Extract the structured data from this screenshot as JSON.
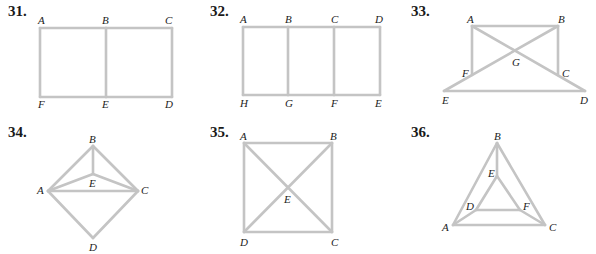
{
  "problems": [
    {
      "number": "31.",
      "vertices": {
        "A": [
          40,
          28
        ],
        "B": [
          106,
          28
        ],
        "C": [
          172,
          28
        ],
        "F": [
          40,
          97
        ],
        "E": [
          106,
          97
        ],
        "D": [
          172,
          97
        ]
      },
      "edges": [
        [
          "A",
          "B"
        ],
        [
          "B",
          "C"
        ],
        [
          "C",
          "D"
        ],
        [
          "D",
          "E"
        ],
        [
          "E",
          "F"
        ],
        [
          "F",
          "A"
        ],
        [
          "B",
          "E"
        ]
      ],
      "labels": [
        {
          "text": "A",
          "x": 38,
          "y": 24
        },
        {
          "text": "B",
          "x": 102,
          "y": 24
        },
        {
          "text": "C",
          "x": 165,
          "y": 24
        },
        {
          "text": "F",
          "x": 38,
          "y": 108
        },
        {
          "text": "E",
          "x": 102,
          "y": 108
        },
        {
          "text": "D",
          "x": 165,
          "y": 108
        }
      ]
    },
    {
      "number": "32.",
      "vertices": {
        "A": [
          243,
          27
        ],
        "B": [
          288,
          27
        ],
        "C": [
          334,
          27
        ],
        "D": [
          380,
          27
        ],
        "H": [
          243,
          95
        ],
        "G": [
          288,
          95
        ],
        "F": [
          334,
          95
        ],
        "E": [
          380,
          95
        ]
      },
      "edges": [
        [
          "A",
          "B"
        ],
        [
          "B",
          "C"
        ],
        [
          "C",
          "D"
        ],
        [
          "D",
          "E"
        ],
        [
          "E",
          "F"
        ],
        [
          "F",
          "G"
        ],
        [
          "G",
          "H"
        ],
        [
          "H",
          "A"
        ],
        [
          "B",
          "G"
        ],
        [
          "C",
          "F"
        ]
      ],
      "labels": [
        {
          "text": "A",
          "x": 240,
          "y": 23
        },
        {
          "text": "B",
          "x": 285,
          "y": 23
        },
        {
          "text": "C",
          "x": 331,
          "y": 23
        },
        {
          "text": "D",
          "x": 375,
          "y": 23
        },
        {
          "text": "H",
          "x": 240,
          "y": 107
        },
        {
          "text": "G",
          "x": 285,
          "y": 107
        },
        {
          "text": "F",
          "x": 331,
          "y": 107
        },
        {
          "text": "E",
          "x": 375,
          "y": 107
        }
      ]
    },
    {
      "number": "33.",
      "vertices": {
        "A": [
          472,
          26
        ],
        "B": [
          558,
          26
        ],
        "F": [
          472,
          75
        ],
        "C": [
          558,
          75
        ],
        "E": [
          444,
          91
        ],
        "D": [
          585,
          91
        ],
        "G": [
          516,
          50
        ]
      },
      "edges": [
        [
          "A",
          "B"
        ],
        [
          "A",
          "F"
        ],
        [
          "B",
          "C"
        ],
        [
          "E",
          "D"
        ],
        [
          "E",
          "B"
        ],
        [
          "A",
          "D"
        ]
      ],
      "labels": [
        {
          "text": "A",
          "x": 467,
          "y": 23
        },
        {
          "text": "B",
          "x": 558,
          "y": 23
        },
        {
          "text": "G",
          "x": 512,
          "y": 66
        },
        {
          "text": "F",
          "x": 462,
          "y": 77
        },
        {
          "text": "C",
          "x": 562,
          "y": 77
        },
        {
          "text": "E",
          "x": 442,
          "y": 104
        },
        {
          "text": "D",
          "x": 580,
          "y": 104
        }
      ]
    },
    {
      "number": "34.",
      "vertices": {
        "B": [
          93,
          146
        ],
        "E": [
          93,
          174
        ],
        "A": [
          48,
          191
        ],
        "C": [
          138,
          191
        ],
        "D": [
          93,
          238
        ]
      },
      "edges": [
        [
          "A",
          "B"
        ],
        [
          "B",
          "C"
        ],
        [
          "B",
          "E"
        ],
        [
          "A",
          "E"
        ],
        [
          "E",
          "C"
        ],
        [
          "A",
          "C"
        ],
        [
          "A",
          "D"
        ],
        [
          "D",
          "C"
        ]
      ],
      "labels": [
        {
          "text": "B",
          "x": 89,
          "y": 143
        },
        {
          "text": "E",
          "x": 89,
          "y": 187
        },
        {
          "text": "A",
          "x": 37,
          "y": 194
        },
        {
          "text": "C",
          "x": 141,
          "y": 194
        },
        {
          "text": "D",
          "x": 89,
          "y": 251
        }
      ]
    },
    {
      "number": "35.",
      "vertices": {
        "A": [
          244,
          143
        ],
        "B": [
          332,
          143
        ],
        "D": [
          244,
          232
        ],
        "C": [
          332,
          232
        ],
        "E": [
          288,
          188
        ]
      },
      "edges": [
        [
          "A",
          "B"
        ],
        [
          "B",
          "C"
        ],
        [
          "C",
          "D"
        ],
        [
          "D",
          "A"
        ],
        [
          "A",
          "C"
        ],
        [
          "B",
          "D"
        ]
      ],
      "labels": [
        {
          "text": "A",
          "x": 240,
          "y": 140
        },
        {
          "text": "B",
          "x": 330,
          "y": 140
        },
        {
          "text": "E",
          "x": 284,
          "y": 203
        },
        {
          "text": "D",
          "x": 240,
          "y": 246
        },
        {
          "text": "C",
          "x": 331,
          "y": 246
        }
      ]
    },
    {
      "number": "36.",
      "vertices": {
        "B": [
          497,
          143
        ],
        "E": [
          497,
          176
        ],
        "D": [
          476,
          210
        ],
        "F": [
          520,
          210
        ],
        "A": [
          453,
          225
        ],
        "C": [
          545,
          225
        ]
      },
      "edges": [
        [
          "A",
          "B"
        ],
        [
          "B",
          "C"
        ],
        [
          "A",
          "C"
        ],
        [
          "B",
          "E"
        ],
        [
          "E",
          "D"
        ],
        [
          "E",
          "F"
        ],
        [
          "D",
          "F"
        ],
        [
          "A",
          "D"
        ],
        [
          "F",
          "C"
        ]
      ],
      "labels": [
        {
          "text": "B",
          "x": 494,
          "y": 140
        },
        {
          "text": "E",
          "x": 488,
          "y": 177
        },
        {
          "text": "D",
          "x": 466,
          "y": 210
        },
        {
          "text": "F",
          "x": 523,
          "y": 210
        },
        {
          "text": "A",
          "x": 442,
          "y": 231
        },
        {
          "text": "C",
          "x": 549,
          "y": 231
        }
      ]
    }
  ],
  "number_positions": [
    [
      8,
      16
    ],
    [
      210,
      16
    ],
    [
      411,
      16
    ],
    [
      8,
      137
    ],
    [
      210,
      137
    ],
    [
      411,
      137
    ]
  ],
  "colors": {
    "edge": "#c4c4c4",
    "label": "#222222",
    "number": "#1a1a1a"
  }
}
